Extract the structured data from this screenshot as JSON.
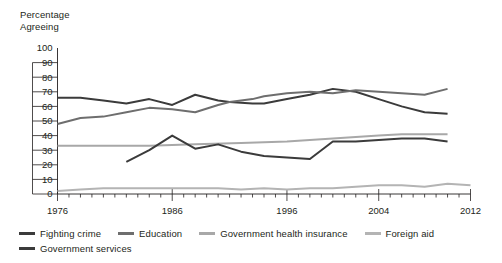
{
  "chart_data": {
    "type": "line",
    "title": "",
    "ylabel": "Percentage\nAgreeing",
    "xlabel": "",
    "ylim": [
      0,
      100
    ],
    "xlim": [
      1976,
      2012
    ],
    "ytick_values": [
      100,
      90,
      80,
      70,
      60,
      50,
      40,
      30,
      20,
      10,
      0
    ],
    "ytick_labels": [
      "100",
      "90",
      "80",
      "70",
      "60",
      "50",
      "40",
      "30",
      "20",
      "10",
      "0"
    ],
    "xtick_labels": [
      "1976",
      "1986",
      "1996",
      "2004",
      "2012"
    ],
    "xtick_values": [
      1976,
      1986,
      1996,
      2004,
      2012
    ],
    "grid": false,
    "legend_position": "bottom-left",
    "minor_tick_interval": 1,
    "series": [
      {
        "name": "Fighting crime",
        "color": "#3b3b3b",
        "x": [
          1976,
          1978,
          1980,
          1982,
          1984,
          1986,
          1988,
          1990,
          1991,
          1993,
          1994,
          1996,
          1998,
          2000,
          2002,
          2004,
          2006,
          2008,
          2010
        ],
        "values": [
          66,
          66,
          64,
          62,
          65,
          61,
          68,
          64,
          63,
          62,
          62,
          65,
          68,
          72,
          70,
          65,
          60,
          56,
          55
        ]
      },
      {
        "name": "Education",
        "color": "#6e6e6e",
        "x": [
          1976,
          1978,
          1980,
          1982,
          1984,
          1986,
          1988,
          1990,
          1991,
          1993,
          1994,
          1996,
          1998,
          2000,
          2002,
          2004,
          2006,
          2008,
          2010
        ],
        "values": [
          48,
          52,
          53,
          56,
          59,
          58,
          56,
          61,
          63,
          65,
          67,
          69,
          70,
          69,
          71,
          70,
          69,
          68,
          72
        ]
      },
      {
        "name": "Government health insurance",
        "color": "#a8a8a8",
        "x": [
          1976,
          1980,
          1984,
          1988,
          1992,
          1996,
          1998,
          2000,
          2002,
          2004,
          2006,
          2008,
          2010
        ],
        "values": [
          33,
          33,
          33,
          34,
          35,
          36,
          37,
          38,
          39,
          40,
          41,
          41,
          41
        ]
      },
      {
        "name": "Foreign aid",
        "color": "#b4b4b4",
        "x": [
          1976,
          1978,
          1980,
          1982,
          1984,
          1986,
          1988,
          1990,
          1992,
          1994,
          1996,
          1998,
          2000,
          2002,
          2004,
          2006,
          2008,
          2010,
          2012
        ],
        "values": [
          2,
          3,
          4,
          4,
          4,
          4,
          4,
          4,
          3,
          4,
          3,
          4,
          4,
          5,
          6,
          6,
          5,
          7,
          6
        ]
      },
      {
        "name": "Government services",
        "color": "#3b3b3b",
        "x": [
          1982,
          1984,
          1986,
          1988,
          1990,
          1992,
          1994,
          1996,
          1998,
          2000,
          2002,
          2004,
          2006,
          2008,
          2010
        ],
        "values": [
          22,
          30,
          40,
          31,
          34,
          29,
          26,
          25,
          24,
          36,
          36,
          37,
          38,
          38,
          36
        ]
      }
    ]
  },
  "legend": {
    "rows": [
      [
        {
          "label": "Fighting crime",
          "color": "#3b3b3b"
        },
        {
          "label": "Education",
          "color": "#6e6e6e"
        },
        {
          "label": "Government health insurance",
          "color": "#a8a8a8"
        },
        {
          "label": "Foreign aid",
          "color": "#b4b4b4"
        }
      ],
      [
        {
          "label": "Government services",
          "color": "#3b3b3b"
        }
      ]
    ]
  },
  "colors": {
    "axis": "#231f20",
    "text": "#231f20",
    "background": "#ffffff"
  }
}
